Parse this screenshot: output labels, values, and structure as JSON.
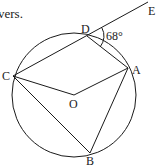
{
  "caption": "vers.",
  "diagram": {
    "circle": {
      "cx": 74,
      "cy": 95,
      "r": 62
    },
    "points": {
      "D": {
        "label": "D",
        "x": 87,
        "y": 36
      },
      "E": {
        "label": "E",
        "x": 148,
        "y": 2
      },
      "C": {
        "label": "C",
        "x": 13,
        "y": 76
      },
      "A": {
        "label": "A",
        "x": 128,
        "y": 68
      },
      "O": {
        "label": "O",
        "x": 74,
        "y": 95
      },
      "B": {
        "label": "B",
        "x": 90,
        "y": 153
      }
    },
    "angle_label": "68°",
    "segments": [
      "C-E",
      "D-A",
      "C-O",
      "O-A",
      "C-B",
      "A-B"
    ]
  }
}
